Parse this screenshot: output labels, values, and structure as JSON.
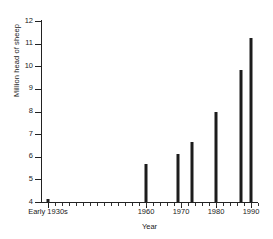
{
  "chart_data": {
    "type": "bar",
    "title": "",
    "xlabel": "Year",
    "ylabel": "Million head of sheep",
    "categories": [
      "Early 1930s",
      "1960",
      "1969",
      "1973",
      "1980",
      "1987",
      "1990"
    ],
    "x": [
      1932,
      1960,
      1969,
      1973,
      1980,
      1987,
      1990
    ],
    "values": [
      4.15,
      5.67,
      6.1,
      6.67,
      8.0,
      9.85,
      11.25
    ],
    "ylim": [
      4,
      12
    ],
    "xlim": [
      1930,
      1992
    ],
    "ytick_labels": [
      "4",
      "5",
      "6",
      "7",
      "8",
      "9",
      "10",
      "11",
      "12"
    ],
    "yticks": [
      4,
      5,
      6,
      7,
      8,
      9,
      10,
      11,
      12
    ],
    "xtick_labels": [
      "Early 1930s",
      "1960",
      "1970",
      "1980",
      "1990"
    ],
    "xticks": [
      1932,
      1960,
      1970,
      1980,
      1990
    ],
    "grid": false,
    "legend": false,
    "bar_color": "#1c1c1c",
    "axis_color": "#222222"
  }
}
